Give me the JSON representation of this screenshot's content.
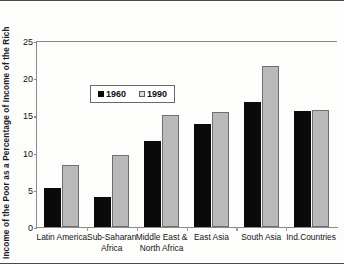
{
  "chart_data": {
    "type": "bar",
    "title": "",
    "xlabel": "",
    "ylabel": "Income of the Poor as a Percentage of Income of the Rich",
    "ylim": [
      0,
      25
    ],
    "yticks": [
      0,
      5,
      10,
      15,
      20,
      25
    ],
    "grid": false,
    "legend_position": "upper-left-inside",
    "categories": [
      "Latin America",
      "Sub-Saharan Africa",
      "Middle East & North Africa",
      "East Asia",
      "South Asia",
      "Ind.Countries"
    ],
    "category_lines": [
      [
        "Latin America",
        ""
      ],
      [
        "Sub-Saharan",
        "Africa"
      ],
      [
        "Middle East &",
        "North Africa"
      ],
      [
        "East Asia",
        ""
      ],
      [
        "South Asia",
        ""
      ],
      [
        "Ind.Countries",
        ""
      ]
    ],
    "series": [
      {
        "name": "1960",
        "color": "#0a0a0a",
        "values": [
          5.2,
          4.0,
          11.6,
          13.9,
          16.8,
          15.6
        ]
      },
      {
        "name": "1990",
        "color": "#b9b9b9",
        "values": [
          8.4,
          9.7,
          15.1,
          15.4,
          21.7,
          15.7
        ]
      }
    ]
  },
  "legend": {
    "items": [
      {
        "label": "1960",
        "swatch": "black-square-icon"
      },
      {
        "label": "1990",
        "swatch": "light-square-icon"
      }
    ]
  },
  "axis": {
    "y_tick_labels": [
      "0",
      "5",
      "10",
      "15",
      "20",
      "25"
    ]
  }
}
